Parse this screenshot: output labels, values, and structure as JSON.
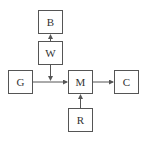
{
  "diagram": {
    "nodes": [
      {
        "id": "B",
        "label": "B",
        "x": 38,
        "y": 10,
        "w": 25,
        "h": 24
      },
      {
        "id": "W",
        "label": "W",
        "x": 38,
        "y": 41,
        "w": 25,
        "h": 24
      },
      {
        "id": "G",
        "label": "G",
        "x": 8,
        "y": 70,
        "w": 25,
        "h": 24
      },
      {
        "id": "M",
        "label": "M",
        "x": 68,
        "y": 70,
        "w": 25,
        "h": 24
      },
      {
        "id": "C",
        "label": "C",
        "x": 114,
        "y": 70,
        "w": 25,
        "h": 24
      },
      {
        "id": "R",
        "label": "R",
        "x": 68,
        "y": 108,
        "w": 25,
        "h": 24
      }
    ],
    "edges": [
      {
        "from": "W",
        "to": "B"
      },
      {
        "from": "W",
        "to": "G-M line"
      },
      {
        "from": "G",
        "to": "M"
      },
      {
        "from": "M",
        "to": "C"
      },
      {
        "from": "R",
        "to": "M"
      }
    ],
    "colors": {
      "stroke": "#555555",
      "text": "#333333",
      "background": "#ffffff"
    }
  }
}
